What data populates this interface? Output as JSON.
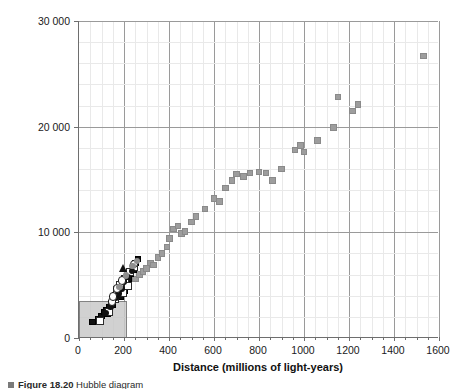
{
  "chart_data": {
    "type": "scatter",
    "title": "",
    "xlabel": "Distance (millions of light-years)",
    "ylabel": "Velocity (km s⁻¹)",
    "xlim": [
      0,
      1600
    ],
    "ylim": [
      0,
      30000
    ],
    "xticks": [
      0,
      200,
      400,
      600,
      800,
      1000,
      1200,
      1400,
      1600
    ],
    "xtick_labels": [
      "0",
      "200",
      "400",
      "600",
      "800",
      "1000",
      "1200",
      "1400",
      "1600"
    ],
    "xticks_major_labeled": [
      0,
      200,
      400,
      600,
      800,
      1000,
      1200,
      1400,
      1600
    ],
    "xgrid_major": [
      200,
      400,
      600,
      800,
      1000,
      1200,
      1400,
      1600
    ],
    "xgrid_minor_step": 50,
    "yticks": [
      0,
      10000,
      20000,
      30000
    ],
    "ytick_labels": [
      "0",
      "10 000",
      "20 000",
      "30 000"
    ],
    "ygrid_major": [
      10000,
      20000,
      30000
    ],
    "ygrid_minor_step": 2000,
    "grid": true,
    "legend_position": "none",
    "annotations": [
      {
        "name": "inset-region-box",
        "kind": "rectangle",
        "x0": 0,
        "y0": 0,
        "x1": 215,
        "y1": 3500,
        "fill": "#c9c9c9",
        "stroke": "#6e6e6e",
        "note": "shaded magnified-region rectangle at lower left"
      },
      {
        "name": "dotted-trend-curve",
        "kind": "dotted-curve",
        "points": [
          [
            95,
            1200
          ],
          [
            130,
            2700
          ],
          [
            165,
            4000
          ],
          [
            200,
            5100
          ],
          [
            235,
            6200
          ],
          [
            262,
            7000
          ],
          [
            275,
            7600
          ]
        ]
      }
    ],
    "series": [
      {
        "name": "far-galaxies-gray-squares",
        "marker": "square",
        "color": "#9d9d9d",
        "points": [
          [
            250,
            5600
          ],
          [
            268,
            6000
          ],
          [
            285,
            6300
          ],
          [
            300,
            6600
          ],
          [
            318,
            7100
          ],
          [
            332,
            6900
          ],
          [
            352,
            7600
          ],
          [
            368,
            8000
          ],
          [
            392,
            8600
          ],
          [
            402,
            9400
          ],
          [
            420,
            10300
          ],
          [
            440,
            10600
          ],
          [
            455,
            9900
          ],
          [
            470,
            10100
          ],
          [
            500,
            11000
          ],
          [
            520,
            11500
          ],
          [
            560,
            12200
          ],
          [
            600,
            13200
          ],
          [
            625,
            12900
          ],
          [
            650,
            14200
          ],
          [
            680,
            14900
          ],
          [
            700,
            15500
          ],
          [
            730,
            15300
          ],
          [
            760,
            15600
          ],
          [
            800,
            15700
          ],
          [
            830,
            15600
          ],
          [
            860,
            14900
          ],
          [
            900,
            16000
          ],
          [
            960,
            17800
          ],
          [
            985,
            18200
          ],
          [
            1000,
            17600
          ],
          [
            1060,
            18700
          ],
          [
            1130,
            19900
          ],
          [
            1150,
            22800
          ],
          [
            1215,
            21500
          ],
          [
            1240,
            22100
          ],
          [
            1530,
            26700
          ]
        ]
      },
      {
        "name": "near-galaxies-black-squares",
        "marker": "square-filled",
        "color": "#111111",
        "points": [
          [
            60,
            1500
          ],
          [
            85,
            1800
          ],
          [
            100,
            2100
          ],
          [
            112,
            2450
          ],
          [
            120,
            2650
          ],
          [
            128,
            2300
          ],
          [
            136,
            2900
          ],
          [
            142,
            3250
          ],
          [
            150,
            3100
          ],
          [
            156,
            3600
          ],
          [
            160,
            4000
          ],
          [
            166,
            4350
          ],
          [
            172,
            4100
          ],
          [
            178,
            4600
          ],
          [
            184,
            3900
          ],
          [
            190,
            4800
          ],
          [
            196,
            5200
          ],
          [
            205,
            4500
          ],
          [
            212,
            5000
          ],
          [
            222,
            5600
          ],
          [
            232,
            6100
          ],
          [
            244,
            6500
          ],
          [
            252,
            7100
          ],
          [
            262,
            7500
          ]
        ]
      },
      {
        "name": "galaxies-open-squares",
        "marker": "square-open",
        "color": "#ffffff",
        "points": [
          [
            92,
            1650
          ],
          [
            135,
            2500
          ],
          [
            158,
            3700
          ],
          [
            170,
            4500
          ],
          [
            182,
            5000
          ],
          [
            196,
            4250
          ],
          [
            204,
            5600
          ],
          [
            216,
            4900
          ],
          [
            228,
            6200
          ],
          [
            246,
            6700
          ]
        ]
      },
      {
        "name": "galaxies-filled-circles",
        "marker": "circle-filled",
        "color": "#111111",
        "points": [
          [
            118,
            2350
          ],
          [
            140,
            3000
          ],
          [
            150,
            3350
          ],
          [
            162,
            3850
          ],
          [
            176,
            4200
          ],
          [
            188,
            4650
          ],
          [
            200,
            5350
          ],
          [
            215,
            5750
          ],
          [
            236,
            6350
          ]
        ]
      },
      {
        "name": "galaxies-open-circles",
        "marker": "circle-open",
        "color": "#ffffff",
        "points": [
          [
            146,
            3450
          ],
          [
            152,
            3950
          ],
          [
            168,
            4700
          ],
          [
            192,
            5450
          ],
          [
            244,
            7000
          ]
        ]
      },
      {
        "name": "galaxies-gray-circles",
        "marker": "circle-gray",
        "color": "#8f8f8f",
        "points": [
          [
            180,
            4850
          ],
          [
            208,
            5900
          ],
          [
            238,
            6800
          ],
          [
            258,
            7300
          ]
        ]
      },
      {
        "name": "galaxy-triangle",
        "marker": "triangle-filled",
        "color": "#111111",
        "points": [
          [
            196,
            6550
          ]
        ]
      }
    ]
  },
  "axes": {
    "x_title": "Distance (millions of light-years)",
    "y_title_main": "Velocity (km s",
    "y_title_exp": "-1",
    "y_title_close": ")",
    "x_tick_labels": [
      "0",
      "200",
      "400",
      "600",
      "800",
      "1000",
      "1200",
      "1400",
      "1600"
    ],
    "y_tick_labels": [
      "0",
      "10 000",
      "20 000",
      "30 000"
    ]
  },
  "caption": {
    "marker": "■",
    "figure_label": "Figure",
    "figure_number": "18.20",
    "text": "Hubble diagram"
  }
}
